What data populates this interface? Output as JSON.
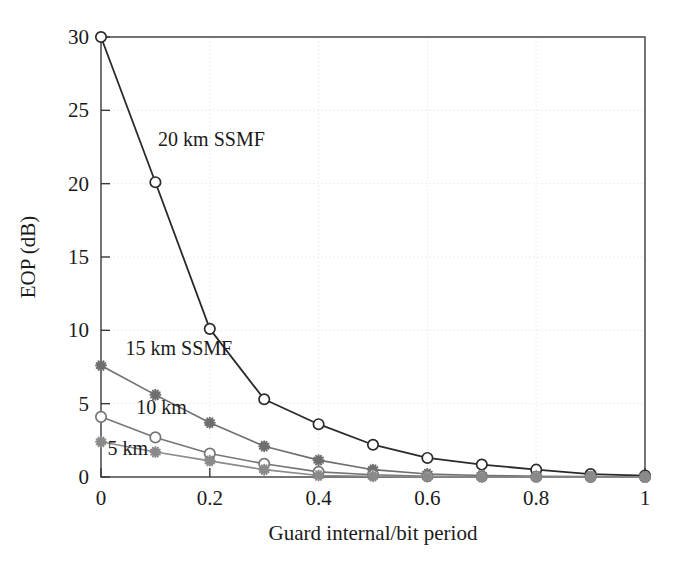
{
  "chart_data": {
    "type": "line",
    "title": "",
    "xlabel": "Guard internal/bit period",
    "ylabel": "EOP (dB)",
    "xlim": [
      0,
      1
    ],
    "ylim": [
      0,
      30
    ],
    "xticks": [
      "0",
      "0.2",
      "0.4",
      "0.6",
      "0.8",
      "1"
    ],
    "xtick_values": [
      0,
      0.2,
      0.4,
      0.6,
      0.8,
      1
    ],
    "yticks": [
      "0",
      "5",
      "10",
      "15",
      "20",
      "25",
      "30"
    ],
    "ytick_values": [
      0,
      5,
      10,
      15,
      20,
      25,
      30
    ],
    "grid": true,
    "grid_style": "dotted",
    "legend_position": "inline-annotations",
    "x": [
      0,
      0.1,
      0.2,
      0.3,
      0.4,
      0.5,
      0.6,
      0.7,
      0.8,
      0.9,
      1.0
    ],
    "series": [
      {
        "name": "20 km SSMF",
        "label": "20 km SSMF",
        "color": "#2a2a2a",
        "marker": "circle-open",
        "values": [
          30.0,
          20.1,
          10.1,
          5.3,
          3.6,
          2.2,
          1.3,
          0.85,
          0.5,
          0.2,
          0.1
        ]
      },
      {
        "name": "15 km SSMF",
        "label": "15 km SSMF",
        "color": "#6e6e6e",
        "marker": "star",
        "values": [
          7.6,
          5.6,
          3.7,
          2.1,
          1.15,
          0.5,
          0.2,
          0.1,
          0.05,
          0.03,
          0.0
        ]
      },
      {
        "name": "10 km",
        "label": "10 km",
        "color": "#757575",
        "marker": "circle-open",
        "values": [
          4.1,
          2.7,
          1.6,
          0.9,
          0.35,
          0.15,
          0.05,
          0.03,
          0.02,
          0.0,
          0.0
        ]
      },
      {
        "name": "5 km",
        "label": "5 km",
        "color": "#8a8a8a",
        "marker": "star",
        "values": [
          2.4,
          1.7,
          1.1,
          0.5,
          0.1,
          0.05,
          0.02,
          0.0,
          0.0,
          0.0,
          0.0
        ]
      }
    ],
    "annotations": [
      {
        "text": "20 km SSMF",
        "x": 0.105,
        "y": 22.6
      },
      {
        "text": "15 km SSMF",
        "x": 0.045,
        "y": 8.3
      },
      {
        "text": "10 km",
        "x": 0.065,
        "y": 4.3
      },
      {
        "text": "5 km",
        "x": 0.012,
        "y": 1.5
      }
    ],
    "axis_color": "#3a3a3a",
    "grid_color": "#e8e8e8",
    "background": "#ffffff"
  }
}
